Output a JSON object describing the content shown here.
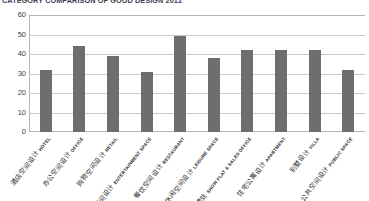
{
  "chart_data": {
    "type": "bar",
    "title": "CATEGORY COMPARISON OF GOOD DESIGN 2012",
    "xlabel": "",
    "ylabel": "",
    "ylim": [
      0,
      60
    ],
    "yticks": [
      0,
      10,
      20,
      30,
      40,
      50,
      60
    ],
    "grid": true,
    "legend": "none",
    "bar_color": "#6e6e6e",
    "categories": [
      "酒店空间设计 HOTEL",
      "办公空间设计 OFFICE",
      "购物空间设计 RETAIL",
      "娱乐空间设计 ENTERTAINMENT SPACE",
      "餐饮空间设计 RESTAURANT",
      "休闲空间设计 LEISURE SPACE",
      "样板间/售楼处 SHOW FLAT & SALES OFFICE",
      "住宅公寓设计 APARTMENT",
      "别墅设计 VILLA",
      "公共空间设计 PUBLIC SPACE"
    ],
    "values": [
      32,
      44,
      39,
      31,
      49,
      38,
      42,
      42,
      42,
      32
    ]
  },
  "axis": {
    "y_tick_labels": [
      "60",
      "50",
      "40",
      "30",
      "20",
      "10",
      "0"
    ]
  },
  "categories_detail": [
    {
      "cn": "酒店空间设计",
      "en": "HOTEL",
      "value": 32
    },
    {
      "cn": "办公空间设计",
      "en": "OFFICE",
      "value": 44
    },
    {
      "cn": "购物空间设计",
      "en": "RETAIL",
      "value": 39
    },
    {
      "cn": "娱乐空间设计",
      "en": "ENTERTAINMENT SPACE",
      "value": 31
    },
    {
      "cn": "餐饮空间设计",
      "en": "RESTAURANT",
      "value": 49
    },
    {
      "cn": "休闲空间设计",
      "en": "LEISURE SPACE",
      "value": 38
    },
    {
      "cn": "样板间/售楼处",
      "en": "SHOW FLAT & SALES OFFICE",
      "value": 42
    },
    {
      "cn": "住宅公寓设计",
      "en": "APARTMENT",
      "value": 42
    },
    {
      "cn": "别墅设计",
      "en": "VILLA",
      "value": 42
    },
    {
      "cn": "公共空间设计",
      "en": "PUBLIC SPACE",
      "value": 32
    }
  ]
}
